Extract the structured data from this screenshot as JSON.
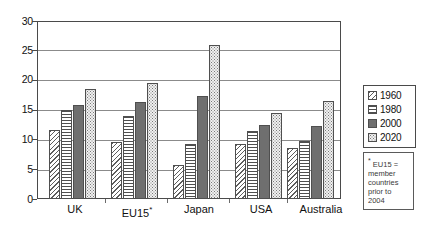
{
  "chart_data": {
    "type": "bar",
    "title": "",
    "xlabel": "",
    "ylabel": "",
    "ylim": [
      0,
      30
    ],
    "ytick_step": 5,
    "yticks": [
      0,
      5,
      10,
      15,
      20,
      25,
      30
    ],
    "ytick_labels": [
      "0",
      "5",
      "10",
      "15",
      "20",
      "25",
      "30"
    ],
    "grid": true,
    "grid_axis": "y",
    "legend_position": "right",
    "categories": [
      "UK",
      "EU15*",
      "Japan",
      "USA",
      "Australia"
    ],
    "series": [
      {
        "name": "1960",
        "pattern": "diagonal-hatch",
        "color": "#ffffff",
        "values": [
          11.7,
          9.6,
          5.7,
          9.2,
          8.6
        ]
      },
      {
        "name": "1980",
        "pattern": "horizontal-lines",
        "color": "#ffffff",
        "values": [
          15.0,
          14.0,
          9.2,
          11.5,
          9.8
        ]
      },
      {
        "name": "2000",
        "pattern": "solid",
        "color": "#6f6f6f",
        "values": [
          15.8,
          16.3,
          17.4,
          12.4,
          12.3
        ]
      },
      {
        "name": "2020",
        "pattern": "fine-dots",
        "color": "#f0f0f0",
        "values": [
          18.5,
          19.6,
          26.0,
          14.5,
          16.6
        ]
      }
    ],
    "annotations": [
      {
        "name": "eu15-footnote",
        "star": "*",
        "lines": [
          "EU15 =",
          "member",
          "countries",
          "prior to",
          "2004"
        ]
      }
    ]
  },
  "legend": {
    "items": [
      {
        "label": "1960"
      },
      {
        "label": "1980"
      },
      {
        "label": "2000"
      },
      {
        "label": "2020"
      }
    ]
  },
  "categories": {
    "uk": "UK",
    "eu15_base": "EU15",
    "eu15_star": "*",
    "japan": "Japan",
    "usa": "USA",
    "australia": "Australia"
  },
  "footnote": {
    "star": "*",
    "line1": "EU15 =",
    "line2": "member",
    "line3": "countries",
    "line4": "prior to",
    "line5": "2004"
  }
}
